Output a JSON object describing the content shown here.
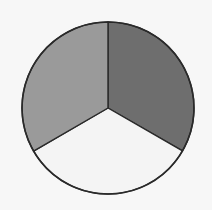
{
  "chart_data": {
    "type": "pie",
    "title": "",
    "labels": [
      "Slice A",
      "Slice B",
      "Slice C"
    ],
    "values": [
      33.33,
      33.33,
      33.34
    ],
    "colors": [
      "#6e6e6e",
      "#f4f4f4",
      "#9a9a9a"
    ],
    "start_angle_deg": -90,
    "direction": "clockwise",
    "legend": "none",
    "data_labels": "none",
    "stroke_color": "#2a2a2a",
    "background": "#f7f7f7",
    "center": [
      108,
      108
    ],
    "radius": 86
  }
}
